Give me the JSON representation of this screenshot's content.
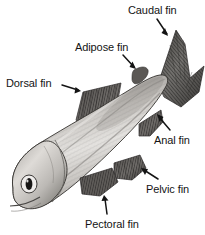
{
  "figure": {
    "style": "grayscale pencil/engraving illustration on white background",
    "background_color": "#ffffff",
    "label_color": "#141414",
    "illustration_colors": {
      "body_light": "#e8e6e3",
      "body_mid": "#b9b6b2",
      "body_dark": "#7d7b78",
      "fin_dark": "#4a4846",
      "outline": "#3a3836",
      "eye_pupil": "#1a1a1a",
      "eye_ring": "#f2f0ee"
    }
  },
  "annotations": [
    {
      "id": "caudal-fin",
      "label": "Caudal fin",
      "label_x": 128,
      "label_y": 4,
      "arrow_from": [
        157,
        19
      ],
      "arrow_to": [
        168,
        36
      ],
      "target": "tail fin"
    },
    {
      "id": "adipose-fin",
      "label": "Adipose fin",
      "label_x": 75,
      "label_y": 41,
      "arrow_from": [
        123,
        55
      ],
      "arrow_to": [
        136,
        69
      ],
      "target": "small fleshy fin behind dorsal fin"
    },
    {
      "id": "dorsal-fin",
      "label": "Dorsal fin",
      "label_x": 6,
      "label_y": 77,
      "arrow_from": [
        62,
        85
      ],
      "arrow_to": [
        81,
        91
      ],
      "target": "large fin on the back"
    },
    {
      "id": "anal-fin",
      "label": "Anal fin",
      "label_x": 154,
      "label_y": 134,
      "arrow_from": [
        170,
        130
      ],
      "arrow_to": [
        157,
        114
      ],
      "target": "fin on ventral side near tail"
    },
    {
      "id": "pelvic-fin",
      "label": "Pelvic fin",
      "label_x": 146,
      "label_y": 183,
      "arrow_from": [
        158,
        179
      ],
      "arrow_to": [
        141,
        168
      ],
      "target": "paired fin on underside"
    },
    {
      "id": "pectoral-fin",
      "label": "Pectoral fin",
      "label_x": 85,
      "label_y": 218,
      "arrow_from": [
        107,
        214
      ],
      "arrow_to": [
        104,
        195
      ],
      "target": "paired fin behind the gill cover"
    }
  ]
}
